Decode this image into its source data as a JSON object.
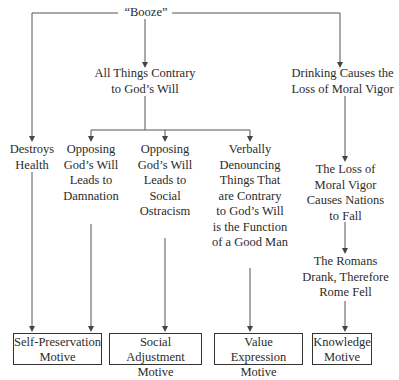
{
  "root": {
    "label": "“Booze”"
  },
  "middle": {
    "label_line1": "All Things Contrary",
    "label_line2": "to God’s Will"
  },
  "right_top": {
    "label_line1": "Drinking Causes the",
    "label_line2": "Loss of Moral Vigor"
  },
  "branches": [
    {
      "lines": [
        "Destroys",
        "Health"
      ]
    },
    {
      "lines": [
        "Opposing",
        "God’s Will",
        "Leads to",
        "Damnation"
      ]
    },
    {
      "lines": [
        "Opposing",
        "God’s Will",
        "Leads to",
        "Social",
        "Ostracism"
      ]
    },
    {
      "lines": [
        "Verbally",
        "Denouncing",
        "Things That",
        "are Contrary",
        "to God’s Will",
        "is the Function",
        "of a Good Man"
      ]
    },
    {
      "lines": [
        "The Loss of",
        "Moral Vigor",
        "Causes Nations",
        "to Fall"
      ]
    },
    {
      "lines": [
        "The Romans",
        "Drank, Therefore",
        "Rome Fell"
      ]
    }
  ],
  "motives": [
    {
      "line1": "Self-Preservation",
      "line2": "Motive"
    },
    {
      "line1": "Social Adjustment",
      "line2": "Motive"
    },
    {
      "line1": "Value Expression",
      "line2": "Motive"
    },
    {
      "line1": "Knowledge",
      "line2": "Motive"
    }
  ]
}
